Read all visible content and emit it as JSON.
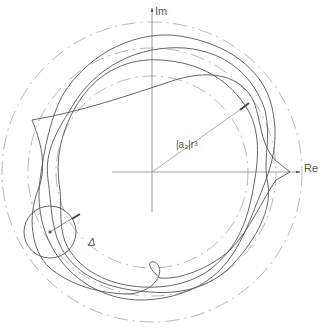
{
  "diagram": {
    "type": "complex-plane-locus",
    "axes": {
      "imaginary_label": "Im",
      "real_label": "Re"
    },
    "annotations": {
      "radius_label": "|a₃|r³",
      "perturbation_label": "Δ"
    },
    "elements": [
      "outer-dashed-circle",
      "middle-dashed-circle",
      "inner-dashed-circle",
      "locus-curves",
      "perturbation-circle",
      "radius-arrow"
    ],
    "colors": {
      "curve": "#555555",
      "dashed": "#b0b0b0",
      "axis": "#888888"
    }
  }
}
